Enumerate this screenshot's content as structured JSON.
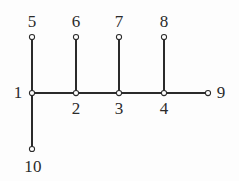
{
  "diagram": {
    "type": "undirected-graph",
    "title": "",
    "canvas": {
      "width": 239,
      "height": 181,
      "background": "#fdfdfd"
    },
    "style": {
      "edge_color": "#2b2b2b",
      "edge_width": 1.1,
      "node_fill": "#ffffff",
      "node_stroke": "#2b2b2b",
      "node_radius": 2.6,
      "label_color": "#2b2b2b",
      "label_font_size": 17
    },
    "nodes": [
      {
        "id": "1",
        "label": "1",
        "x": 32,
        "y": 93,
        "label_x": 18,
        "label_y": 92,
        "label_pos": "left"
      },
      {
        "id": "2",
        "label": "2",
        "x": 76,
        "y": 93,
        "label_x": 76,
        "label_y": 108,
        "label_pos": "below"
      },
      {
        "id": "3",
        "label": "3",
        "x": 119,
        "y": 93,
        "label_x": 119,
        "label_y": 108,
        "label_pos": "below"
      },
      {
        "id": "4",
        "label": "4",
        "x": 164,
        "y": 93,
        "label_x": 164,
        "label_y": 108,
        "label_pos": "below"
      },
      {
        "id": "5",
        "label": "5",
        "x": 32,
        "y": 37,
        "label_x": 32,
        "label_y": 21,
        "label_pos": "above"
      },
      {
        "id": "6",
        "label": "6",
        "x": 76,
        "y": 37,
        "label_x": 76,
        "label_y": 21,
        "label_pos": "above"
      },
      {
        "id": "7",
        "label": "7",
        "x": 119,
        "y": 37,
        "label_x": 119,
        "label_y": 21,
        "label_pos": "above"
      },
      {
        "id": "8",
        "label": "8",
        "x": 164,
        "y": 37,
        "label_x": 164,
        "label_y": 21,
        "label_pos": "above"
      },
      {
        "id": "9",
        "label": "9",
        "x": 208,
        "y": 93,
        "label_x": 221,
        "label_y": 92,
        "label_pos": "right"
      },
      {
        "id": "10",
        "label": "10",
        "x": 32,
        "y": 149,
        "label_x": 33,
        "label_y": 166,
        "label_pos": "below"
      }
    ],
    "edges": [
      {
        "from": "1",
        "to": "2"
      },
      {
        "from": "2",
        "to": "3"
      },
      {
        "from": "3",
        "to": "4"
      },
      {
        "from": "4",
        "to": "9"
      },
      {
        "from": "1",
        "to": "5"
      },
      {
        "from": "2",
        "to": "6"
      },
      {
        "from": "3",
        "to": "7"
      },
      {
        "from": "4",
        "to": "8"
      },
      {
        "from": "1",
        "to": "10"
      }
    ]
  }
}
